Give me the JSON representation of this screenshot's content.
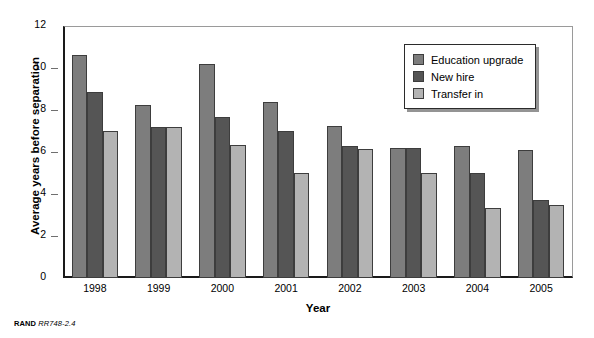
{
  "chart_data": {
    "type": "bar",
    "title": "",
    "xlabel": "Year",
    "ylabel": "Average years before separation",
    "categories": [
      "1998",
      "1999",
      "2000",
      "2001",
      "2002",
      "2003",
      "2004",
      "2005"
    ],
    "series": [
      {
        "name": "Education upgrade",
        "color": "#7d7d7d",
        "values": [
          10.6,
          8.25,
          10.2,
          8.4,
          7.25,
          6.2,
          6.3,
          6.1
        ]
      },
      {
        "name": "New hire",
        "color": "#555555",
        "values": [
          8.85,
          7.2,
          7.65,
          7.0,
          6.3,
          6.2,
          5.0,
          3.7
        ]
      },
      {
        "name": "Transfer in",
        "color": "#b3b3b3",
        "values": [
          7.0,
          7.2,
          6.35,
          5.0,
          6.15,
          5.0,
          3.35,
          3.5
        ]
      }
    ],
    "ylim": [
      0,
      12
    ],
    "yticks": [
      0,
      2,
      4,
      6,
      8,
      10,
      12
    ],
    "ytick_labels": [
      "0",
      "2",
      "4",
      "6",
      "8",
      "10",
      "12"
    ],
    "grid": false,
    "legend_position": "top-right"
  },
  "legend": {
    "entries": [
      {
        "label": "Education upgrade"
      },
      {
        "label": "New hire"
      },
      {
        "label": "Transfer in"
      }
    ]
  },
  "source_note": {
    "organization": "RAND",
    "identifier": "RR748-2.4"
  }
}
